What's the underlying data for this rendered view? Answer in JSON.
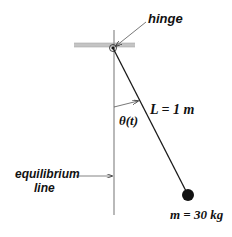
{
  "diagram": {
    "type": "pendulum",
    "labels": {
      "hinge": "hinge",
      "length": "L = 1 m",
      "angle": "θ(t)",
      "equilibrium_line": [
        "equilibrium",
        "line"
      ],
      "mass": "m = 30 kg"
    },
    "geometry": {
      "ceiling": {
        "x1": 74,
        "x2": 135,
        "y": 45
      },
      "pivot": {
        "x": 113,
        "y": 47
      },
      "equilibrium_line": {
        "x": 114,
        "y1": 30,
        "y2": 215
      },
      "bob": {
        "x": 188,
        "y": 195,
        "r": 6
      }
    },
    "colors": {
      "ceiling": "#b8b8b8",
      "lines": "#222222",
      "equilibrium_line": "#888888",
      "bob": "#111111"
    }
  }
}
